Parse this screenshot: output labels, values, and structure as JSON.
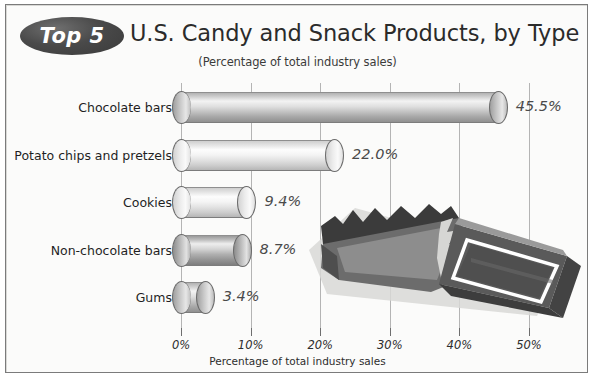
{
  "header": {
    "badge_label": "Top 5",
    "title": "U.S. Candy and Snack Products, by Type",
    "subtitle": "(Percentage of total industry sales)"
  },
  "colors": {
    "frame_border": "#7b7b7b",
    "background": "#fbfbfa",
    "badge_fill": "#3a3a3a",
    "badge_text": "#ffffff",
    "gridline": "#b4b4b4",
    "value_text": "#4a4a4a",
    "candy_wrapper_dark": "#3b3b3b",
    "candy_wrapper_mid": "#6d6d6d",
    "candy_bar_face": "#585858",
    "candy_highlight": "#ffffff"
  },
  "icons": {
    "badge": "oval-badge-icon",
    "candy": "candy-bar-icon"
  },
  "chart_data": {
    "type": "bar",
    "orientation": "horizontal",
    "title": "U.S. Candy and Snack Products, by Type",
    "subtitle": "(Percentage of total industry sales)",
    "xlabel": "Percentage of total industry sales",
    "ylabel": "",
    "xlim": [
      0,
      55
    ],
    "xticks": [
      0,
      10,
      20,
      30,
      40,
      50
    ],
    "xtick_labels": [
      "0%",
      "10%",
      "20%",
      "30%",
      "40%",
      "50%"
    ],
    "grid": true,
    "legend": false,
    "categories": [
      "Chocolate bars",
      "Potato chips and pretzels",
      "Cookies",
      "Non-chocolate bars",
      "Gums"
    ],
    "values": [
      45.5,
      22.0,
      9.4,
      8.7,
      3.4
    ],
    "data_labels": [
      "45.5%",
      "22.0%",
      "9.4%",
      "8.7%",
      "3.4%"
    ],
    "bar_styles": [
      "mid",
      "light",
      "light",
      "dark",
      "mid"
    ],
    "units": "percent"
  }
}
